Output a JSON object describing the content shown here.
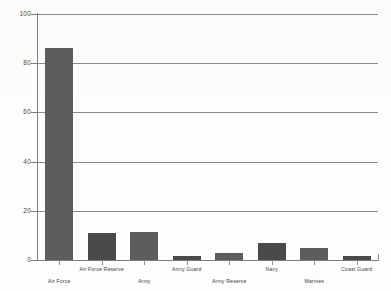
{
  "chart_data": {
    "type": "bar",
    "title": "",
    "subtitle": "",
    "xlabel": "",
    "ylabel": "",
    "ylim": [
      0,
      100
    ],
    "yticks": [
      0,
      20,
      40,
      60,
      80,
      100
    ],
    "grid": true,
    "legend": false,
    "categories": [
      "Air Force",
      "Air Force Reserve",
      "Army",
      "Army Guard",
      "Army Reserve",
      "Navy",
      "Marines",
      "Coast Guard"
    ],
    "values": [
      86,
      11,
      11.5,
      1.5,
      3,
      7,
      5,
      1.5
    ],
    "bar_color": "#5d5d5d",
    "axis_color": "#7d7d7d",
    "grid_color": "#8b8b8b"
  },
  "axis": {
    "y_tick_labels": [
      "100",
      "80",
      "60",
      "40",
      "20",
      "0"
    ]
  }
}
